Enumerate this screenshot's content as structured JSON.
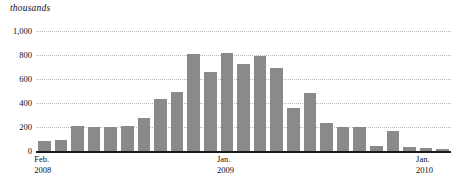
{
  "units_label": "thousands",
  "chart_data": {
    "type": "bar",
    "title": "",
    "subtitle": "",
    "xlabel": "",
    "ylabel": "thousands",
    "grid": true,
    "legend": false,
    "ylim": [
      0,
      1000
    ],
    "ytick_labels": [
      "1,000",
      "800",
      "600",
      "400",
      "200",
      "0"
    ],
    "ytick_values": [
      1000,
      800,
      600,
      400,
      200,
      0
    ],
    "categories": [
      "Feb. 2008",
      "Mar. 2008",
      "Apr. 2008",
      "May 2008",
      "Jun. 2008",
      "Jul. 2008",
      "Aug. 2008",
      "Sep. 2008",
      "Oct. 2008",
      "Nov. 2008",
      "Dec. 2008",
      "Jan. 2009",
      "Feb. 2009",
      "Mar. 2009",
      "Apr. 2009",
      "May 2009",
      "Jun. 2009",
      "Jul. 2009",
      "Aug. 2009",
      "Sep. 2009",
      "Oct. 2009",
      "Nov. 2009",
      "Dec. 2009",
      "Jan. 2010",
      "Feb. 2010"
    ],
    "values": [
      85,
      95,
      210,
      200,
      200,
      212,
      275,
      435,
      490,
      805,
      660,
      815,
      725,
      795,
      690,
      360,
      480,
      230,
      200,
      200,
      40,
      170,
      30,
      25,
      20
    ],
    "axis_tick_labels": [
      {
        "month": "Feb.",
        "year": "2008",
        "index": 0
      },
      {
        "month": "Jan.",
        "year": "2009",
        "index": 11
      },
      {
        "month": "Jan.",
        "year": "2010",
        "index": 23
      }
    ],
    "bar_color": "#8a8a8a",
    "gridline_color": "#b9b9b9",
    "axis_color": "#1a1a1a"
  }
}
